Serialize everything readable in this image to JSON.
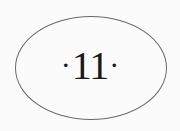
{
  "page_ornament": {
    "left_mark": "·",
    "number": "11",
    "right_mark": "·"
  }
}
